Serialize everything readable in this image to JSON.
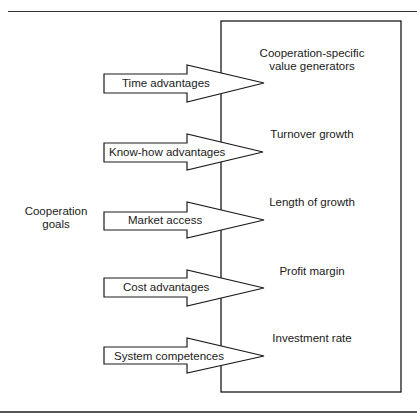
{
  "diagram": {
    "left_label": {
      "line1": "Cooperation",
      "line2": "goals"
    },
    "arrows": [
      {
        "label": "Time advantages"
      },
      {
        "label": "Know-how advantages"
      },
      {
        "label": "Market access"
      },
      {
        "label": "Cost advantages"
      },
      {
        "label": "System competences"
      }
    ],
    "box": {
      "title_line1": "Cooperation-specific",
      "title_line2": "value generators",
      "items": [
        {
          "label": "Turnover growth"
        },
        {
          "label": "Length of growth"
        },
        {
          "label": "Profit margin"
        },
        {
          "label": "Investment rate"
        }
      ]
    },
    "colors": {
      "stroke": "#1a1a1a",
      "fill": "#ffffff"
    }
  }
}
